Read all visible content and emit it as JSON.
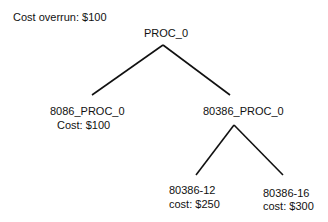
{
  "header": {
    "cost_overrun": "Cost overrun:  $100"
  },
  "tree": {
    "root": {
      "label": "PROC_0"
    },
    "children": [
      {
        "label": "8086_PROC_0",
        "cost": "Cost: $100"
      },
      {
        "label": "80386_PROC_0",
        "children": [
          {
            "label": "80386-12",
            "cost": "cost: $250"
          },
          {
            "label": "80386-16",
            "cost": "cost: $300"
          }
        ]
      }
    ]
  }
}
